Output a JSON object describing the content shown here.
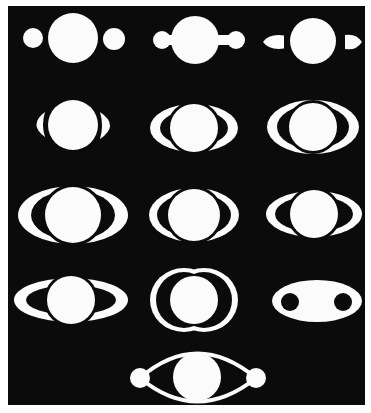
{
  "canvas": {
    "width": 371,
    "height": 413,
    "paper": "#ffffff"
  },
  "frame": {
    "x": 8,
    "y": 6,
    "width": 357,
    "height": 399,
    "fill": "#0b0b0b"
  },
  "colors": {
    "ink": "#fbfbfb",
    "background": "#0b0b0b"
  },
  "figures": [
    {
      "id": "r1c1",
      "type": "planet-with-two-moons",
      "cx": 73,
      "cy": 38,
      "r": 25,
      "moons": [
        {
          "cx": 33,
          "cy": 38,
          "r": 10
        },
        {
          "cx": 114,
          "cy": 39,
          "r": 11
        }
      ]
    },
    {
      "id": "r1c2",
      "type": "planet-with-lobes",
      "cx": 195,
      "cy": 40,
      "r": 24,
      "lobes": [
        {
          "cx": 162,
          "cy": 40,
          "r": 9
        },
        {
          "cx": 236,
          "cy": 40,
          "r": 9
        }
      ]
    },
    {
      "id": "r1c3",
      "type": "planet-with-teardrops",
      "cx": 313,
      "cy": 41,
      "r": 23,
      "left": {
        "x1": 263,
        "x2": 284,
        "cy": 42,
        "h": 13
      },
      "right": {
        "x1": 345,
        "x2": 362,
        "cy": 42,
        "h": 14
      }
    },
    {
      "id": "r2c1",
      "type": "planet-with-crescents",
      "cx": 73,
      "cy": 125,
      "r": 25,
      "left": {
        "x1": 32,
        "x2": 45,
        "y1": 112,
        "y2": 137
      },
      "right": {
        "x1": 100,
        "x2": 116,
        "y1": 112,
        "y2": 139
      }
    },
    {
      "id": "r2c2",
      "type": "ring-ellipse",
      "cx": 194,
      "cy": 128,
      "rx": 44,
      "ry": 24,
      "planet_r": 24,
      "inner_rx": 34,
      "inner_ry": 18
    },
    {
      "id": "r2c3",
      "type": "ring-ellipse",
      "cx": 313,
      "cy": 127,
      "rx": 46,
      "ry": 27,
      "planet_r": 24,
      "inner_rx": 36,
      "inner_ry": 22
    },
    {
      "id": "r3c1",
      "type": "ring-ellipse",
      "cx": 73,
      "cy": 215,
      "rx": 55,
      "ry": 29,
      "planet_r": 28,
      "inner_rx": 42,
      "inner_ry": 25
    },
    {
      "id": "r3c2",
      "type": "ring-ellipse",
      "cx": 194,
      "cy": 215,
      "rx": 45,
      "ry": 27,
      "planet_r": 26,
      "inner_rx": 37,
      "inner_ry": 22
    },
    {
      "id": "r3c3",
      "type": "ring-ellipse",
      "cx": 314,
      "cy": 214,
      "rx": 48,
      "ry": 23,
      "planet_r": 24,
      "inner_rx": 39,
      "inner_ry": 18
    },
    {
      "id": "r4c1",
      "type": "ring-ellipse",
      "cx": 71,
      "cy": 300,
      "rx": 57,
      "ry": 22,
      "planet_r": 24,
      "inner_rx": 45,
      "inner_ry": 15
    },
    {
      "id": "r4c2",
      "type": "double-arc",
      "cx": 194,
      "cy": 300,
      "planet_r": 24,
      "rx": 46,
      "ry": 32
    },
    {
      "id": "r4c3",
      "type": "ellipse-with-holes",
      "cx": 317,
      "cy": 301,
      "rx": 45,
      "ry": 21,
      "holes": [
        {
          "cx": 290,
          "cy": 302,
          "r": 9
        },
        {
          "cx": 343,
          "cy": 302,
          "r": 9
        }
      ]
    },
    {
      "id": "r5c1",
      "type": "planet-with-linked-moons",
      "cx": 197,
      "cy": 377,
      "r": 24,
      "moons": [
        {
          "cx": 140,
          "cy": 378,
          "r": 10
        },
        {
          "cx": 256,
          "cy": 378,
          "r": 10
        }
      ]
    }
  ]
}
